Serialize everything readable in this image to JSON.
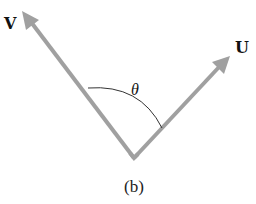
{
  "figure": {
    "caption": "(b)",
    "angle_label": "θ",
    "vectors": [
      {
        "name": "V",
        "label": "V",
        "tail": [
          134,
          158
        ],
        "head": [
          23,
          12
        ]
      },
      {
        "name": "U",
        "label": "U",
        "tail": [
          134,
          158
        ],
        "head": [
          229,
          57
        ]
      }
    ],
    "colors": {
      "vector": "#a0a0a0",
      "arc": "#333333",
      "text": "#111111",
      "background": "#ffffff"
    }
  }
}
